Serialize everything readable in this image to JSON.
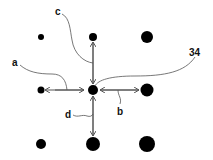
{
  "diagram": {
    "colors": {
      "dot": "#000000",
      "line": "#555555",
      "label": "#111111"
    },
    "dots": [
      {
        "x": 41,
        "y": 37,
        "r": 3
      },
      {
        "x": 93,
        "y": 37,
        "r": 4
      },
      {
        "x": 147,
        "y": 37,
        "r": 6
      },
      {
        "x": 41,
        "y": 90,
        "r": 3.5
      },
      {
        "x": 93,
        "y": 90,
        "r": 5
      },
      {
        "x": 147,
        "y": 90,
        "r": 6.5
      },
      {
        "x": 41,
        "y": 144,
        "r": 5
      },
      {
        "x": 93,
        "y": 144,
        "r": 7
      },
      {
        "x": 147,
        "y": 144,
        "r": 8
      }
    ],
    "labels": {
      "a": "a",
      "b": "b",
      "c": "c",
      "d": "d",
      "ref": "34"
    }
  }
}
